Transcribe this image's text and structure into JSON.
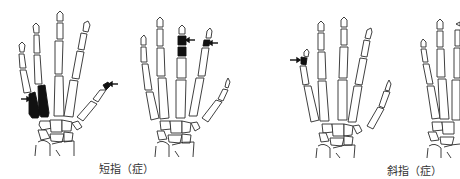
{
  "figure": {
    "captions": [
      {
        "id": "brachydactyly",
        "text": "短指（症）"
      },
      {
        "id": "clinodactyly",
        "text": "斜指（症）"
      }
    ],
    "panels": [
      {
        "id": "hand-1",
        "group": "brachydactyly",
        "note": "shortened 4th and 5th metacarpals highlighted; arrows point to them and to thumb distal phalanx"
      },
      {
        "id": "hand-2",
        "group": "brachydactyly",
        "note": "shortened middle finger phalanges and index distal phalanx highlighted"
      },
      {
        "id": "hand-3",
        "group": "clinodactyly",
        "note": "little finger middle phalanx highlighted (curved finger)"
      },
      {
        "id": "hand-4",
        "group": "clinodactyly",
        "note": "partially visible hand, cut off at right edge"
      }
    ],
    "colors": {
      "line": "#2a2a2a",
      "highlight": "#111111",
      "background": "#ffffff"
    }
  }
}
